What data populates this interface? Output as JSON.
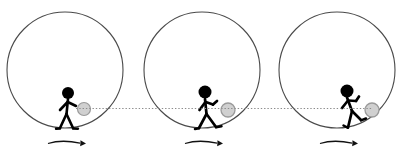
{
  "figure": {
    "caption": "",
    "canvas": {
      "width": 403,
      "height": 161,
      "background": "#ffffff"
    },
    "colors": {
      "wheel_stroke": "#4a4a4a",
      "figure_fill": "#000000",
      "ball_fill": "#d0d0d0",
      "ball_stroke": "#9a9a9a",
      "dotted_line": "#8c8c8c",
      "arrow": "#111111"
    },
    "geometry": {
      "wheel_radius": 58,
      "wheel_stroke_width": 1,
      "dotted_line_y": 108,
      "arrow_y": 144
    },
    "panels": [
      {
        "id": "panel-1",
        "label": "Panel 1",
        "wheel": {
          "cx": 65,
          "cy": 70,
          "r": 58
        },
        "figure": {
          "state": "upright-walking",
          "head_cx": 68,
          "head_cy": 93,
          "head_r": 6,
          "lean_deg": 0
        },
        "ball": {
          "cx": 84,
          "cy": 109,
          "r": 6.5
        },
        "arrow": {
          "cx": 68,
          "cy": 144,
          "direction": "right"
        }
      },
      {
        "id": "panel-2",
        "label": "Panel 2",
        "wheel": {
          "cx": 202,
          "cy": 70,
          "r": 58
        },
        "figure": {
          "state": "mid-stride",
          "head_cx": 205,
          "head_cy": 92,
          "head_r": 6.5,
          "lean_deg": 4
        },
        "ball": {
          "cx": 228,
          "cy": 110,
          "r": 7
        },
        "arrow": {
          "cx": 202,
          "cy": 144,
          "direction": "right"
        }
      },
      {
        "id": "panel-3",
        "label": "Panel 3",
        "wheel": {
          "cx": 337,
          "cy": 70,
          "r": 58
        },
        "figure": {
          "state": "leaning-on-slope",
          "head_cx": 347,
          "head_cy": 91,
          "head_r": 6.5,
          "lean_deg": 18
        },
        "ball": {
          "cx": 372,
          "cy": 110,
          "r": 7
        },
        "arrow": {
          "cx": 337,
          "cy": 144,
          "direction": "right"
        }
      }
    ]
  }
}
